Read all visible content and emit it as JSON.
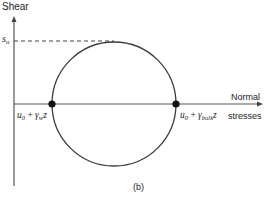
{
  "figure": {
    "panel_label": "(b)",
    "y_axis_label": "Shear",
    "x_axis_label_line1": "Normal",
    "x_axis_label_line2": "stresses",
    "su_label": {
      "main": "s",
      "sub": "u"
    },
    "left_point_label": {
      "a": "u",
      "a_sub": "0",
      "op": " + ",
      "b": "γ",
      "b_sub": "w",
      "c": "z"
    },
    "right_point_label": {
      "a": "u",
      "a_sub": "0",
      "op": " + ",
      "b": "γ",
      "b_sub": "bulk",
      "c": "z"
    },
    "colors": {
      "line": "#3a3a3a",
      "axis": "#555555",
      "dot": "#111111"
    }
  }
}
